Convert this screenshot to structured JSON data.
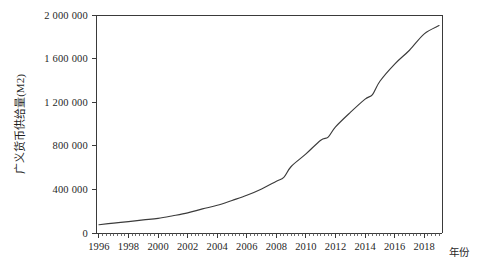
{
  "chart_data": {
    "type": "line",
    "title": "",
    "subtitle": "",
    "xlabel": "年份",
    "ylabel": "广义货币供给量(M2)",
    "xlim": [
      1995.8,
      2019.2
    ],
    "ylim": [
      0,
      2000000
    ],
    "grid": false,
    "legend": null,
    "y_ticks": [
      0,
      400000,
      800000,
      1200000,
      1600000,
      2000000
    ],
    "y_tick_labels": [
      "0",
      "400 000",
      "800 000",
      "1 200 000",
      "1 600 000",
      "2 000 000"
    ],
    "x_ticks": [
      1996,
      1998,
      2000,
      2002,
      2004,
      2006,
      2008,
      2010,
      2012,
      2014,
      2016,
      2018
    ],
    "x_tick_labels": [
      "1996",
      "1998",
      "2000",
      "2002",
      "2004",
      "2006",
      "2008",
      "2010",
      "2012",
      "2014",
      "2016",
      "2018"
    ],
    "x_minor_tick_step": 0.25,
    "series": [
      {
        "name": "广义货币供给量(M2)",
        "color": "#3b3b3b",
        "x": [
          1996,
          1997,
          1998,
          1999,
          2000,
          2001,
          2002,
          2003,
          2004,
          2005,
          2006,
          2007,
          2008,
          2008.5,
          2009,
          2010,
          2011,
          2011.5,
          2012,
          2013,
          2014,
          2014.5,
          2015,
          2016,
          2017,
          2018,
          2019
        ],
        "values": [
          76095,
          90996,
          104499,
          119898,
          134610,
          158302,
          185007,
          221223,
          254107,
          298756,
          345578,
          403442,
          475167,
          510000,
          610225,
          725852,
          851591,
          880000,
          974149,
          1106525,
          1228375,
          1270000,
          1392278,
          1550067,
          1676768,
          1826744,
          1902670
        ]
      }
    ],
    "annotations": []
  },
  "plot_area": {
    "left": 96,
    "right": 442,
    "top": 15,
    "bottom": 233
  }
}
